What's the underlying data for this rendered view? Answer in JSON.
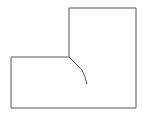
{
  "diagram": {
    "background": "#ffffff",
    "stroke_color": "#555555",
    "outline_points": "11,57 69,57 69,8 136,8 136,108 11,108",
    "curve_path": "M69,57 L82,70 Q85,76 87,84"
  }
}
